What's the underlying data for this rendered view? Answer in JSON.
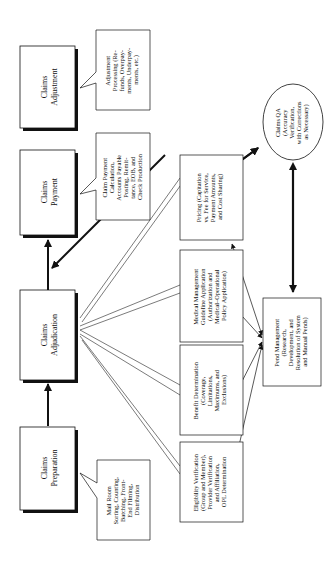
{
  "diagram": {
    "orientation": "rotated-90-ccw",
    "main_stages": [
      {
        "id": "adjustment",
        "title_lines": [
          "Claims",
          "Adjustment"
        ]
      },
      {
        "id": "payment",
        "title_lines": [
          "Claims",
          "Payment"
        ]
      },
      {
        "id": "adjudication",
        "title_lines": [
          "Claims",
          "Adjudication"
        ]
      },
      {
        "id": "preparation",
        "title_lines": [
          "Claims",
          "Preparation"
        ]
      }
    ],
    "callouts": [
      {
        "id": "adjustment-detail",
        "lines": [
          "Adjustment",
          "Processing (Re-",
          "funds, Overpay-",
          "ments, Underpay-",
          "ments, etc.)"
        ]
      },
      {
        "id": "payment-detail",
        "lines": [
          "Claim Payment",
          "Calculation,",
          "Accounts Payable",
          "Posting, Remit-",
          "tance, EOB, and",
          "Check Production"
        ]
      },
      {
        "id": "preparation-detail",
        "lines": [
          "Mail Room",
          "Sorting, Counting,",
          "Batching, Front-",
          "End Filming,",
          "Distribution"
        ]
      }
    ],
    "adjudication_steps": [
      {
        "id": "pricing",
        "lines": [
          "Pricing (Capitation",
          "vs. Fee for Service,",
          "Payment Amounts,",
          "and Cost Sharing)"
        ]
      },
      {
        "id": "medical-management",
        "lines": [
          "Medical Management",
          "Guideline Application",
          "(Authorization and",
          "Medical–Operational",
          "Policy Application)"
        ]
      },
      {
        "id": "benefit-determination",
        "lines": [
          "Benefit Determination",
          "(Coverage,",
          "Limitations,",
          "Maximums, and",
          "Exclusions)"
        ]
      },
      {
        "id": "eligibility-verification",
        "lines": [
          "Eligibility Verification",
          "(Group and Member),",
          "Provider Verification",
          "and Affiliation,",
          "OPL Determination"
        ]
      }
    ],
    "pend_management": {
      "lines": [
        "Pend Management",
        "(Research,",
        "Development, and",
        "Resolution of System",
        "and Manual Pends)"
      ]
    },
    "claims_qa": {
      "lines": [
        "Claims QA",
        "(Accuracy",
        "Verification,",
        "with Corrections",
        "as Necessary)"
      ]
    }
  }
}
